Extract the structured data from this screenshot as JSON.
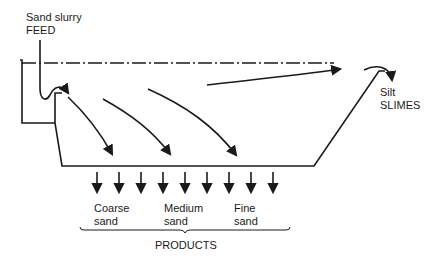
{
  "diagram": {
    "type": "classifier-flow-schematic",
    "feed": {
      "line1": "Sand slurry",
      "line2": "FEED"
    },
    "overflow": {
      "line1": "Silt",
      "line2": "SLIMES"
    },
    "products": [
      {
        "line1": "Coarse",
        "line2": "sand"
      },
      {
        "line1": "Medium",
        "line2": "sand"
      },
      {
        "line1": "Fine",
        "line2": "sand"
      }
    ],
    "products_label": "PRODUCTS",
    "discharge_arrow_count": 9,
    "settling_arrow_count": 3,
    "colors": {
      "line": "#1a1a1a",
      "background": "#ffffff"
    }
  }
}
